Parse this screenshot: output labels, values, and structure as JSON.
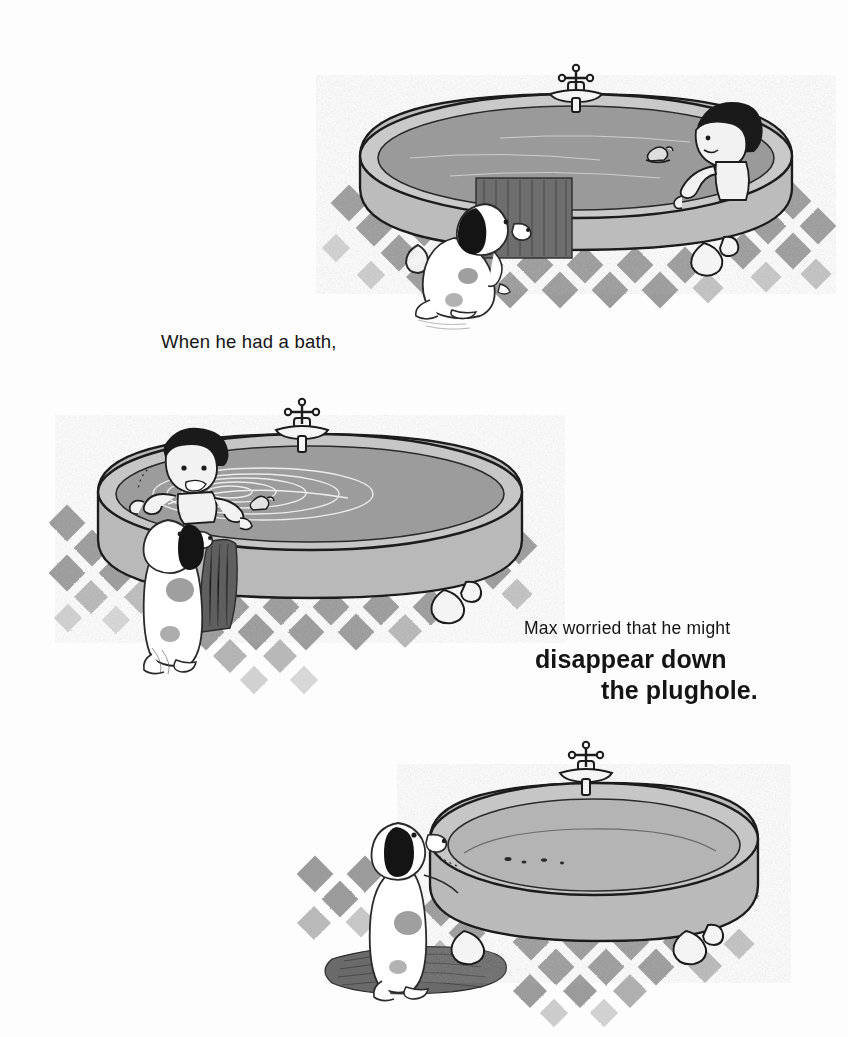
{
  "page": {
    "background_color": "#fdfdfd",
    "text_color": "#141414"
  },
  "captions": {
    "line1": "When he had a bath,",
    "line2": "Max worried that he might",
    "line3": "disappear down",
    "line4": "the plughole."
  },
  "palette": {
    "ink": "#1c1c1c",
    "tub_body": "#b9b9b9",
    "tub_rim": "#c6c6c6",
    "water": "#9a9a9a",
    "tile": "#8e8e8e",
    "towel": "#6e6e6e",
    "mat": "#6a6a6a",
    "dog_body": "#ffffff",
    "dog_patch": "#141414",
    "dog_spot": "#9f9f9f",
    "hair": "#1a1a1a",
    "skin": "#f2f2f2"
  },
  "panels": [
    {
      "id": "panel-1",
      "name": "boy-bathing-in-full-tub",
      "description": "Claw-foot bathtub full of water, Max sitting at the right end with arm raised, a rubber duck floating, a towel draped over the front rim, and the dog sitting on the checkered floor at the left looking up.",
      "elements": [
        "bathtub",
        "tap",
        "bathwater",
        "rubber-duck",
        "boy-max",
        "towel",
        "dog",
        "checkered-floor"
      ]
    },
    {
      "id": "panel-2",
      "name": "boy-in-draining-tub",
      "description": "The same tub seen from the other side. Max is at the left end with a worried face, arms up, as the water swirls into a whirlpool. The dog stands with its front paws against the tub rim beside a hanging towel.",
      "elements": [
        "bathtub",
        "tap",
        "draining-water",
        "whirlpool-swirl",
        "rubber-duck",
        "boy-max",
        "dog",
        "towel",
        "checkered-floor"
      ]
    },
    {
      "id": "panel-3",
      "name": "empty-tub-with-dog",
      "description": "The bathtub is now empty. The dog stands on a bath mat with its front paws on the tub rim, peering in at the drips left in the bottom.",
      "elements": [
        "bathtub",
        "tap",
        "empty-tub-interior",
        "dog",
        "bath-mat",
        "checkered-floor"
      ]
    }
  ]
}
